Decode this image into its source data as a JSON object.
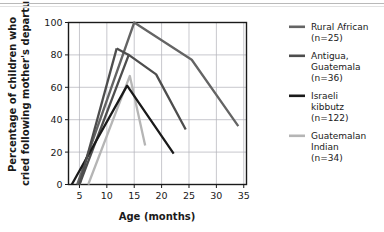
{
  "chart_data": {
    "type": "line",
    "title": "",
    "xlabel": "Age (months)",
    "ylabel": "Percentage of children who cried following mother's departure",
    "ylabel_line1": "Percentage of children who",
    "ylabel_line2": "cried following mother's departure",
    "xlim": [
      3,
      35.5
    ],
    "ylim": [
      0,
      100
    ],
    "xticks": [
      5,
      10,
      15,
      20,
      25,
      30,
      35
    ],
    "yticks": [
      0,
      20,
      40,
      60,
      80,
      100
    ],
    "grid": true,
    "legend_position": "right",
    "series": [
      {
        "name": "Rural African",
        "legend_line1": "Rural African",
        "legend_line2": "(n=25)",
        "n": 25,
        "color": "#646464",
        "points": [
          [
            4.6,
            0
          ],
          [
            15.0,
            100
          ],
          [
            25.5,
            77
          ],
          [
            34.0,
            36
          ]
        ]
      },
      {
        "name": "Antigua, Guatemala",
        "legend_line1": "Antigua,",
        "legend_line2": "Guatemala",
        "legend_line3": "(n=36)",
        "n": 36,
        "color": "#4d4d4d",
        "points": [
          [
            5.0,
            0
          ],
          [
            14.0,
            80
          ],
          [
            19.0,
            68
          ],
          [
            24.4,
            34
          ]
        ]
      },
      {
        "name": "Israeli kibbutz",
        "legend_line1": "Israeli",
        "legend_line2": "kibbutz",
        "legend_line3": "(n=122)",
        "n": 122,
        "color": "#1a1a1a",
        "points": [
          [
            3.6,
            0
          ],
          [
            13.7,
            61
          ],
          [
            22.2,
            19
          ]
        ]
      },
      {
        "name": "Guatemalan Indian",
        "legend_line1": "Guatemalan",
        "legend_line2": "Indian",
        "legend_line3": "(n=34)",
        "n": 34,
        "color": "#b5b5b5",
        "points": [
          [
            6.6,
            0
          ],
          [
            14.2,
            67
          ],
          [
            17.0,
            24
          ]
        ]
      },
      {
        "name": "Antigua peak line",
        "color": "#4d4d4d",
        "points": [
          [
            11.8,
            84
          ],
          [
            14.0,
            80
          ]
        ]
      }
    ],
    "extra_series": [
      {
        "name": "dark-gray-peak-left",
        "color": "#4d4d4d",
        "points": [
          [
            5.0,
            0
          ],
          [
            11.8,
            84
          ]
        ]
      }
    ]
  },
  "axes": {
    "x_tick_labels": [
      "5",
      "10",
      "15",
      "20",
      "25",
      "30",
      "35"
    ],
    "y_tick_labels": [
      "0",
      "20",
      "40",
      "60",
      "80",
      "100"
    ],
    "x_axis_title": "Age (months)",
    "y_axis_title_line1": "Percentage of children who",
    "y_axis_title_line2": "cried following mother's departure"
  },
  "legend": {
    "entries": [
      {
        "label_lines": [
          "Rural African",
          "(n=25)"
        ],
        "color": "#646464"
      },
      {
        "label_lines": [
          "Antigua,",
          "Guatemala",
          "(n=36)"
        ],
        "color": "#4d4d4d"
      },
      {
        "label_lines": [
          "Israeli",
          "kibbutz",
          "(n=122)"
        ],
        "color": "#1a1a1a"
      },
      {
        "label_lines": [
          "Guatemalan",
          "Indian",
          "(n=34)"
        ],
        "color": "#b5b5b5"
      }
    ]
  },
  "colors": {
    "plot_border": "#1a1a1a",
    "grid": "#b0b0b8",
    "background": "#ffffff",
    "text": "#1a1a1a",
    "top_rule": "#b9b9b9"
  }
}
